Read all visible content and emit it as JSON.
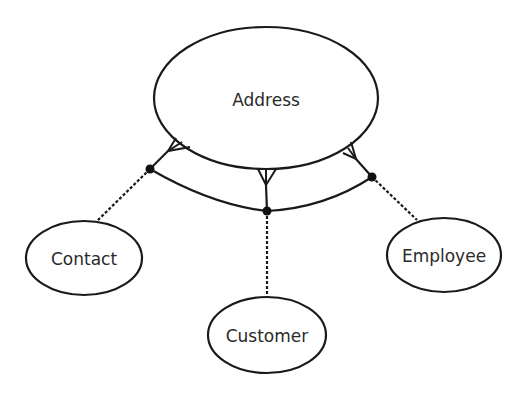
{
  "diagram": {
    "type": "entity-relationship",
    "notation": "crow's foot with exclusive-arc subtype relationship",
    "colors": {
      "line": "#1a1a1a",
      "fill": "#ffffff",
      "text": "#2a2a2a",
      "dot": "#111111"
    },
    "entities": [
      {
        "id": "address",
        "label": "Address",
        "cx": 266,
        "cy": 98,
        "rx": 112,
        "ry": 71
      },
      {
        "id": "contact",
        "label": "Contact",
        "cx": 84,
        "cy": 258,
        "rx": 58,
        "ry": 37
      },
      {
        "id": "customer",
        "label": "Customer",
        "cx": 267,
        "cy": 335,
        "rx": 59,
        "ry": 38
      },
      {
        "id": "employee",
        "label": "Employee",
        "cx": 444,
        "cy": 255,
        "rx": 57,
        "ry": 37
      }
    ],
    "relationships": [
      {
        "from": "address",
        "to": "contact",
        "cardinality_at_address": "many",
        "line_to_entity": "dashed"
      },
      {
        "from": "address",
        "to": "customer",
        "cardinality_at_address": "many",
        "line_to_entity": "dashed"
      },
      {
        "from": "address",
        "to": "employee",
        "cardinality_at_address": "many",
        "line_to_entity": "dashed"
      }
    ],
    "exclusive_arc": {
      "description": "arc connecting the three relationship lines below Address",
      "junctions": [
        {
          "entity": "contact",
          "x": 150,
          "y": 169
        },
        {
          "entity": "customer",
          "x": 267,
          "y": 211
        },
        {
          "entity": "employee",
          "x": 372,
          "y": 177
        }
      ]
    }
  }
}
